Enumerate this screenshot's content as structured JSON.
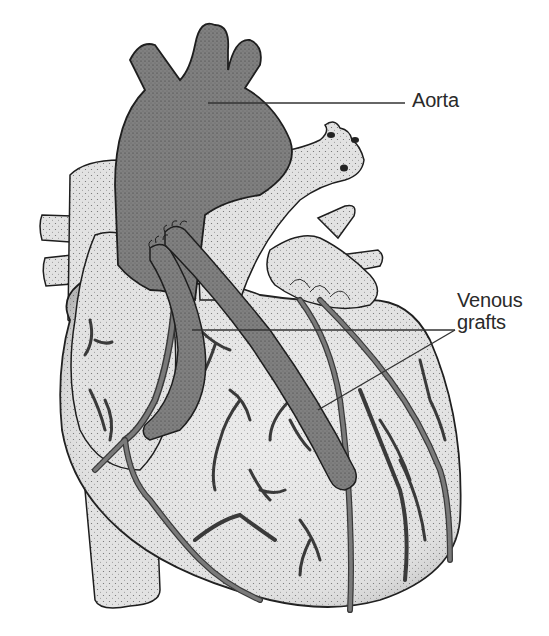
{
  "figure": {
    "labels": {
      "aorta": "Aorta",
      "venous_grafts_line1": "Venous",
      "venous_grafts_line2": "grafts"
    },
    "colors": {
      "background": "#ffffff",
      "heart_fill": "#dcdcdc",
      "aorta_fill": "#7d7d7d",
      "vessel_fill": "#6e6e6e",
      "graft_fill": "#6a6a6a",
      "outline": "#1e1e1e",
      "label_text": "#2a2a2a",
      "leader_line": "#333333"
    }
  }
}
